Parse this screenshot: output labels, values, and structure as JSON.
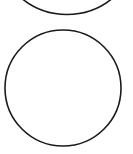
{
  "canvas": {
    "width": 133,
    "height": 154,
    "background_color": "#ffffff",
    "description": "two outlined circles on a plain white background"
  },
  "shapes": [
    {
      "name": "top-circle-cropped",
      "type": "circle",
      "cx": 67,
      "cy": -57,
      "r": 71.5,
      "stroke_color": "#1b1b1b",
      "stroke_width": 1.6,
      "fill_color": "#ffffff",
      "cropped": "true",
      "notes": "only the lower arc is visible; the arc meets the top edge near x=25 and x=110 and bottoms out near y=14"
    },
    {
      "name": "main-circle",
      "type": "circle",
      "cx": 63,
      "cy": 88,
      "r": 58,
      "stroke_color": "#1b1b1b",
      "stroke_width": 1.6,
      "fill_color": "#ffffff",
      "cropped": "false",
      "notes": "complete circle spanning roughly x=5 to x=121 and y=30 to y=146"
    }
  ]
}
